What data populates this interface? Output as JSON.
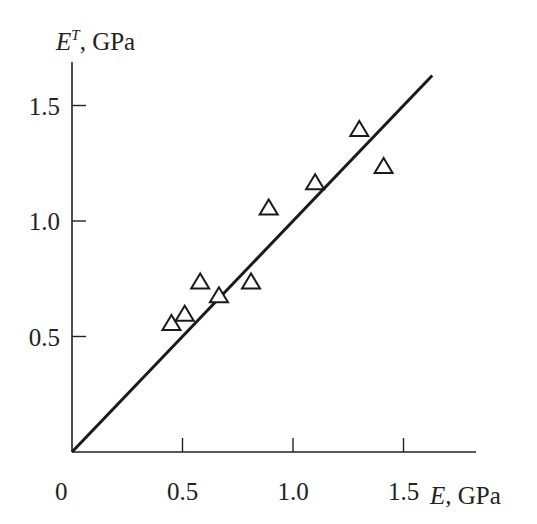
{
  "chart_data": {
    "type": "scatter",
    "title": "",
    "xlabel": "E, GPa",
    "ylabel": "E^T, GPa",
    "xlabel_parts": {
      "symbol": "E",
      "unit": ", GPa"
    },
    "ylabel_parts": {
      "symbol": "E",
      "superscript": "T",
      "unit": ", GPa"
    },
    "xlim": [
      0,
      1.83
    ],
    "ylim": [
      0,
      1.69
    ],
    "xticks": [
      0.5,
      1.0,
      1.5
    ],
    "xtick_labels": [
      "0.5",
      "1.0",
      "1.5"
    ],
    "yticks": [
      0.5,
      1.0,
      1.5
    ],
    "ytick_labels": [
      "0.5",
      "1.0",
      "1.5"
    ],
    "origin_label": "0",
    "grid": false,
    "legend": null,
    "series": [
      {
        "name": "measurements",
        "marker": "open-triangle",
        "x": [
          0.45,
          0.51,
          0.58,
          0.665,
          0.81,
          0.89,
          1.1,
          1.3,
          1.41
        ],
        "y": [
          0.55,
          0.59,
          0.73,
          0.67,
          0.73,
          1.05,
          1.16,
          1.39,
          1.23
        ]
      },
      {
        "name": "fit line (E^T = E)",
        "type": "line",
        "x": [
          0,
          1.63
        ],
        "y": [
          0,
          1.63
        ]
      }
    ]
  },
  "layout": {
    "origin_px": [
      72,
      452
    ],
    "px_per_unit_x": 221,
    "px_per_unit_y": 231,
    "x_axis_end_px": 476,
    "y_axis_top_px": 62
  }
}
